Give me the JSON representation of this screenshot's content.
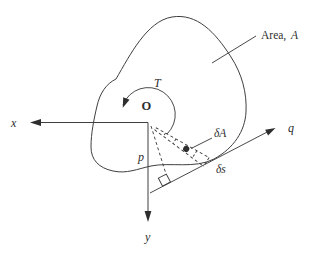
{
  "figure": {
    "area_label": {
      "prefix": "Area,",
      "symbol": "A"
    },
    "torque_label": "T",
    "origin_label": "O",
    "x_axis_label": "x",
    "y_axis_label": "y",
    "q_axis_label": "q",
    "p_distance_label": "p",
    "delta_area_label": "δA",
    "delta_s_label": "δs",
    "colors": {
      "line": "#3f3f3f",
      "text": "#2e2e2e",
      "background": "#ffffff"
    }
  }
}
